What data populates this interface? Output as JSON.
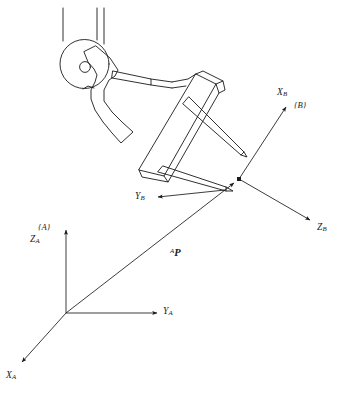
{
  "figure": {
    "caption": ""
  },
  "frames": {
    "base": {
      "name": "{A}",
      "origin": [
        66,
        313
      ],
      "axes": [
        {
          "key": "z",
          "label": "Z",
          "subscript": "A",
          "label_pos": [
            31,
            235
          ],
          "tip": [
            66,
            228
          ]
        },
        {
          "key": "y",
          "label": "Y",
          "subscript": "A",
          "label_pos": [
            166,
            306
          ],
          "tip": [
            159,
            313
          ]
        },
        {
          "key": "x",
          "label": "X",
          "subscript": "A",
          "label_pos": [
            6,
            377
          ],
          "tip": [
            20,
            364
          ]
        }
      ]
    },
    "tool": {
      "name": "{B}",
      "origin": [
        239,
        179
      ],
      "axes": [
        {
          "key": "x",
          "label": "X",
          "subscript": "B",
          "label_pos": [
            278,
            92
          ],
          "tip": [
            287,
            106
          ]
        },
        {
          "key": "z",
          "label": "Z",
          "subscript": "B",
          "label_pos": [
            318,
            227
          ],
          "tip": [
            312,
            221
          ]
        },
        {
          "key": "y",
          "label": "Y",
          "subscript": "B",
          "label_pos": [
            136,
            199
          ],
          "tip": [
            157,
            196
          ]
        }
      ]
    }
  },
  "vector": {
    "label_leading_superscript": "A",
    "label_symbol": "P",
    "label_pos": [
      171,
      251
    ],
    "from": [
      66,
      313
    ],
    "to": [
      236,
      182
    ]
  },
  "robot": {
    "part_names": [
      "upper-column",
      "shoulder-joint",
      "shoulder-pivot",
      "upper-arm-body",
      "forearm-link",
      "wrist-plate",
      "gripper-finger-upper",
      "gripper-finger-lower"
    ]
  },
  "style": {
    "stroke": "#1a1a1a",
    "background": "#ffffff",
    "text": "#1a1a1a"
  }
}
